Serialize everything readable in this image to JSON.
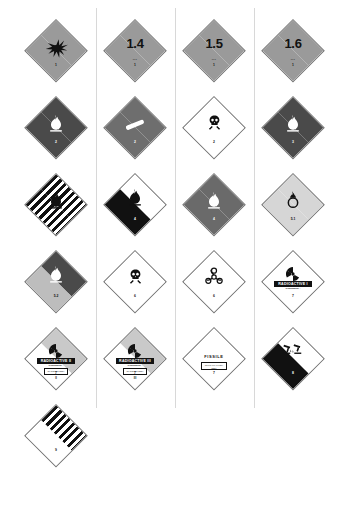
{
  "sheet": {
    "title": "Dangerous goods hazard placards chart",
    "background": "#ffffff",
    "columns": 4,
    "rows": 6
  },
  "colors": {
    "explosive_orange": "#9a9a9a",
    "flammable_red": "#4a4a4a",
    "nonflammable_green": "#6e6e6e",
    "toxic_white": "#ffffff",
    "spontaneous_white_black": "#ffffff",
    "dangerous_wet_blue": "#6a6a6a",
    "oxidizer_yellow": "#d6d6d6",
    "organic_peroxide_red": "#4a4a4a",
    "organic_peroxide_yellow": "#bdbdbd",
    "radioactive_yellow": "#c9c9c9",
    "corrosive_black": "#111111",
    "border_black": "#111111"
  },
  "placards": [
    {
      "id": "explosive-1",
      "row": 0,
      "col": 0,
      "name": "Explosive division 1.1 / 1.2 / 1.3",
      "art": "exploding-bomb-icon",
      "class_number": "1",
      "big_text": "",
      "compat_group": "",
      "top_color": "#9a9a9a",
      "bottom_color": "#9a9a9a",
      "text_color": "dark"
    },
    {
      "id": "explosive-1-4",
      "row": 0,
      "col": 1,
      "name": "Explosive division 1.4",
      "art": "none",
      "class_number": "1",
      "big_text": "1.4",
      "compat_group": "•••",
      "top_color": "#9a9a9a",
      "bottom_color": "#9a9a9a",
      "text_color": "dark"
    },
    {
      "id": "explosive-1-5",
      "row": 0,
      "col": 2,
      "name": "Explosive division 1.5",
      "art": "none",
      "class_number": "1",
      "big_text": "1.5",
      "compat_group": "•••",
      "top_color": "#9a9a9a",
      "bottom_color": "#9a9a9a",
      "text_color": "dark"
    },
    {
      "id": "explosive-1-6",
      "row": 0,
      "col": 3,
      "name": "Explosive division 1.6",
      "art": "none",
      "class_number": "1",
      "big_text": "1.6",
      "compat_group": "•••",
      "top_color": "#9a9a9a",
      "bottom_color": "#9a9a9a",
      "text_color": "dark"
    },
    {
      "id": "flammable-gas-2",
      "row": 1,
      "col": 0,
      "name": "Flammable gas",
      "art": "flame-icon-white",
      "class_number": "2",
      "big_text": "",
      "compat_group": "",
      "top_color": "#4a4a4a",
      "bottom_color": "#4a4a4a",
      "text_color": "light"
    },
    {
      "id": "non-flammable-gas-2",
      "row": 1,
      "col": 1,
      "name": "Non-flammable non-toxic gas",
      "art": "gas-cylinder-icon-white",
      "class_number": "2",
      "big_text": "",
      "compat_group": "",
      "top_color": "#6e6e6e",
      "bottom_color": "#6e6e6e",
      "text_color": "light"
    },
    {
      "id": "toxic-gas-2",
      "row": 1,
      "col": 2,
      "name": "Toxic gas",
      "art": "skull-crossbones-icon-black",
      "class_number": "2",
      "big_text": "",
      "compat_group": "",
      "top_color": "#ffffff",
      "bottom_color": "#ffffff",
      "text_color": "dark"
    },
    {
      "id": "flammable-liquid-3",
      "row": 1,
      "col": 3,
      "name": "Flammable liquid",
      "art": "flame-icon-white",
      "class_number": "3",
      "big_text": "",
      "compat_group": "",
      "top_color": "#4a4a4a",
      "bottom_color": "#4a4a4a",
      "text_color": "light"
    },
    {
      "id": "flammable-solid-4-1",
      "row": 2,
      "col": 0,
      "name": "Flammable solid",
      "art": "flame-icon-black-striped",
      "class_number": "4",
      "big_text": "",
      "compat_group": "",
      "top_color": "stripes",
      "bottom_color": "stripes",
      "text_color": "dark"
    },
    {
      "id": "spontaneously-combustible-4-2",
      "row": 2,
      "col": 1,
      "name": "Spontaneously combustible",
      "art": "flame-icon-black",
      "class_number": "4",
      "big_text": "",
      "compat_group": "",
      "top_color": "#ffffff",
      "bottom_color": "#111111",
      "text_color": "light"
    },
    {
      "id": "dangerous-when-wet-4-3",
      "row": 2,
      "col": 2,
      "name": "Dangerous when wet",
      "art": "flame-icon-white",
      "class_number": "4",
      "big_text": "",
      "compat_group": "",
      "top_color": "#6a6a6a",
      "bottom_color": "#6a6a6a",
      "text_color": "light"
    },
    {
      "id": "oxidizer-5-1",
      "row": 2,
      "col": 3,
      "name": "Oxidizing agent",
      "art": "flaming-circle-icon-black",
      "class_number": "5.1",
      "big_text": "",
      "compat_group": "",
      "top_color": "#d6d6d6",
      "bottom_color": "#d6d6d6",
      "text_color": "dark"
    },
    {
      "id": "organic-peroxide-5-2",
      "row": 3,
      "col": 0,
      "name": "Organic peroxide",
      "art": "flame-icon-white",
      "class_number": "5.2",
      "big_text": "",
      "compat_group": "",
      "top_color": "#4a4a4a",
      "bottom_color": "#bdbdbd",
      "text_color": "dark"
    },
    {
      "id": "toxic-6-1",
      "row": 3,
      "col": 1,
      "name": "Toxic substance",
      "art": "skull-crossbones-icon-black",
      "class_number": "6",
      "big_text": "",
      "compat_group": "",
      "top_color": "#ffffff",
      "bottom_color": "#ffffff",
      "text_color": "dark"
    },
    {
      "id": "infectious-6-2",
      "row": 3,
      "col": 2,
      "name": "Infectious substance",
      "art": "biohazard-icon-black",
      "class_number": "6",
      "big_text": "",
      "compat_group": "",
      "top_color": "#ffffff",
      "bottom_color": "#ffffff",
      "text_color": "dark"
    },
    {
      "id": "radioactive-i-7",
      "row": 3,
      "col": 3,
      "name": "Radioactive category I",
      "art": "trefoil-icon-black",
      "class_number": "7",
      "big_text": "",
      "compat_group": "",
      "top_color": "#ffffff",
      "bottom_color": "#ffffff",
      "text_color": "dark",
      "bar_label": "RADIOACTIVE I",
      "sub_label": "CONTENTS...\nACTIVITY...",
      "stripe_count": 0
    },
    {
      "id": "radioactive-ii-7",
      "row": 4,
      "col": 0,
      "name": "Radioactive category II",
      "art": "trefoil-icon-black",
      "class_number": "7",
      "big_text": "",
      "compat_group": "",
      "top_color": "#c9c9c9",
      "bottom_color": "#ffffff",
      "text_color": "dark",
      "bar_label": "RADIOACTIVE II",
      "sub_label": "CONTENTS...\nACTIVITY...",
      "index_label": "TRANSPORT INDEX",
      "stripe_count": 2
    },
    {
      "id": "radioactive-iii-7",
      "row": 4,
      "col": 1,
      "name": "Radioactive category III",
      "art": "trefoil-icon-black",
      "class_number": "7",
      "big_text": "",
      "compat_group": "",
      "top_color": "#c9c9c9",
      "bottom_color": "#ffffff",
      "text_color": "dark",
      "bar_label": "RADIOACTIVE III",
      "sub_label": "CONTENTS...\nACTIVITY...",
      "index_label": "TRANSPORT INDEX",
      "stripe_count": 3
    },
    {
      "id": "fissile-7",
      "row": 4,
      "col": 2,
      "name": "Fissile material",
      "art": "none",
      "class_number": "7",
      "big_text": "",
      "compat_group": "",
      "top_color": "#ffffff",
      "bottom_color": "#ffffff",
      "text_color": "dark",
      "fissile_label": "FISSILE",
      "index_label": "CRITICALITY SAFETY INDEX"
    },
    {
      "id": "corrosive-8",
      "row": 4,
      "col": 3,
      "name": "Corrosive substance",
      "art": "corrosion-icon-black",
      "class_number": "8",
      "big_text": "",
      "compat_group": "",
      "top_color": "#ffffff",
      "bottom_color": "#111111",
      "text_color": "light"
    },
    {
      "id": "miscellaneous-9",
      "row": 5,
      "col": 0,
      "name": "Miscellaneous dangerous goods",
      "art": "none",
      "class_number": "9",
      "big_text": "",
      "compat_group": "",
      "top_color": "stripes",
      "bottom_color": "#ffffff",
      "text_color": "dark"
    }
  ]
}
